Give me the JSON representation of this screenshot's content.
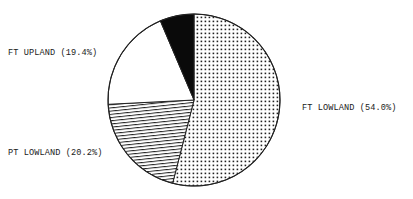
{
  "chart_data": {
    "type": "pie",
    "title": "",
    "start_angle_deg": 0,
    "direction": "clockwise",
    "center": [
      194,
      100
    ],
    "radius": 86,
    "slices": [
      {
        "label": "FT LOWLAND",
        "value": 54.0,
        "display": "FT LOWLAND (54.0%)",
        "fill": "dots",
        "label_pos": [
          302,
          110
        ],
        "label_anchor": "start"
      },
      {
        "label": "PT LOWLAND",
        "value": 20.2,
        "display": "PT LOWLAND (20.2%)",
        "fill": "hatch",
        "label_pos": [
          8,
          155
        ],
        "label_anchor": "start"
      },
      {
        "label": "FT UPLAND",
        "value": 19.4,
        "display": "FT UPLAND (19.4%)",
        "fill": "white",
        "label_pos": [
          8,
          55
        ],
        "label_anchor": "start"
      },
      {
        "label": "",
        "value": 6.4,
        "display": "",
        "fill": "black",
        "label_pos": null,
        "label_anchor": "start"
      }
    ],
    "colors": {
      "stroke": "#222222",
      "black": "#0a0a0a",
      "white": "#ffffff",
      "pattern": "#222222"
    },
    "legend": "none"
  }
}
